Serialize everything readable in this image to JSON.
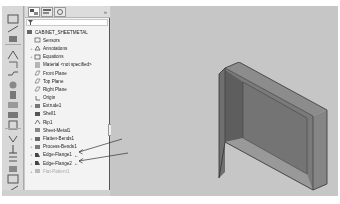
{
  "panel": {
    "tabs": [
      {
        "name": "FeatureManager design tree",
        "icon": "feature-tree-icon",
        "active": true
      },
      {
        "name": "PropertyManager",
        "icon": "property-manager-icon",
        "active": false
      },
      {
        "name": "ConfigurationManager",
        "icon": "configuration-manager-icon",
        "active": false
      }
    ],
    "close_label": "»",
    "filter_icon": "filter-icon",
    "tree": {
      "root": {
        "label": "CABINET_SHEETMETAL",
        "icon": "part-icon"
      },
      "items": [
        {
          "label": "Sensors",
          "icon": "sensor-icon",
          "expandable": false
        },
        {
          "label": "Annotations",
          "icon": "annotations-icon",
          "expandable": true
        },
        {
          "label": "Equations",
          "icon": "equations-icon",
          "expandable": true
        },
        {
          "label": "Material <not specified>",
          "icon": "material-icon",
          "expandable": false
        },
        {
          "label": "Front Plane",
          "icon": "plane-icon",
          "expandable": false
        },
        {
          "label": "Top Plane",
          "icon": "plane-icon",
          "expandable": false
        },
        {
          "label": "Right Plane",
          "icon": "plane-icon",
          "expandable": false
        },
        {
          "label": "Origin",
          "icon": "origin-icon",
          "expandable": false
        },
        {
          "label": "Extrude1",
          "icon": "extrude-icon",
          "expandable": true
        },
        {
          "label": "Shell1",
          "icon": "shell-icon",
          "expandable": false
        },
        {
          "label": "Rip1",
          "icon": "rip-icon",
          "expandable": false
        },
        {
          "label": "Sheet-Metal1",
          "icon": "sheet-metal-icon",
          "expandable": false
        },
        {
          "label": "Flatten-Bends1",
          "icon": "flatten-bends-icon",
          "expandable": true
        },
        {
          "label": "Process-Bends1",
          "icon": "process-bends-icon",
          "expandable": true
        },
        {
          "label": "Edge-Flange1",
          "icon": "edge-flange-icon",
          "expandable": true,
          "annotated": true
        },
        {
          "label": "Edge-Flange2",
          "icon": "edge-flange-icon",
          "expandable": true,
          "annotated": true
        },
        {
          "label": "Flat-Pattern1",
          "icon": "flat-pattern-icon",
          "expandable": true,
          "suppressed": true
        }
      ]
    }
  },
  "command_bar": {
    "icons": [
      "sketch-icon",
      "smart-dimension-icon",
      "base-flange-icon",
      "miter-flange-icon",
      "hem-icon",
      "jog-icon",
      "sketched-bend-icon",
      "closed-corner-icon",
      "fold-icon",
      "unfold-icon",
      "flatten-icon",
      "no-bends-icon",
      "rip-icon",
      "insert-bends-icon",
      "extruded-cut-icon",
      "simple-hole-icon",
      "vent-icon"
    ]
  },
  "annotations": {
    "arrow_mark": "←"
  },
  "graphics": {
    "model": "sheet-metal-cabinet-box"
  }
}
